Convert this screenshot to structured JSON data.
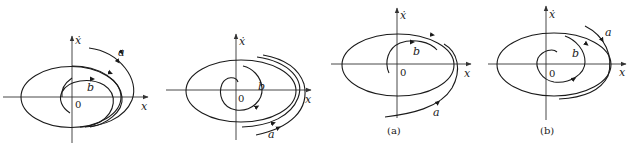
{
  "figure": {
    "panels": [
      {
        "id": "panel-1",
        "x_axis_label": "x",
        "y_axis_label": "ẋ",
        "origin_label": "0",
        "trajectory_labels": [
          "a",
          "b"
        ],
        "caption": ""
      },
      {
        "id": "panel-2",
        "x_axis_label": "x",
        "y_axis_label": "ẋ",
        "origin_label": "0",
        "trajectory_labels": [
          "a",
          "b"
        ],
        "caption": ""
      },
      {
        "id": "panel-3",
        "x_axis_label": "x",
        "y_axis_label": "ẋ",
        "origin_label": "0",
        "trajectory_labels": [
          "a",
          "b"
        ],
        "caption": "(a)"
      },
      {
        "id": "panel-4",
        "x_axis_label": "x",
        "y_axis_label": "ẋ",
        "origin_label": "0",
        "trajectory_labels": [
          "a",
          "b"
        ],
        "caption": "(b)"
      }
    ],
    "colors": {
      "stroke": "#1a1a1a",
      "background": "#ffffff"
    }
  }
}
